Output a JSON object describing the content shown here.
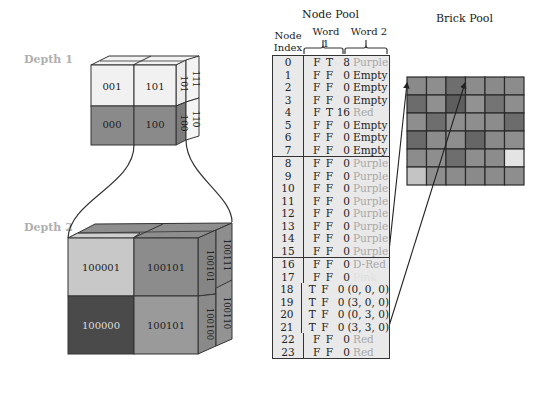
{
  "labels": {
    "depth1": "Depth 1",
    "depth2": "Depth 2",
    "node_pool": "Node Pool",
    "brick_pool": "Brick Pool",
    "node_index": "Node\nIndex",
    "node_index_line1": "Node",
    "node_index_line2": "Index",
    "word1": "Word 1",
    "word2": "Word 2"
  },
  "depth1_cube": {
    "front": [
      {
        "label": "001",
        "fill": "#f1f1f1"
      },
      {
        "label": "101",
        "fill": "#f1f1f1"
      },
      {
        "label": "000",
        "fill": "#8a8a8a"
      },
      {
        "label": "100",
        "fill": "#8a8a8a"
      }
    ],
    "side": [
      {
        "label": "101",
        "fill": "#ebebeb"
      },
      {
        "label": "111",
        "fill": "#f4f4f4"
      },
      {
        "label": "100",
        "fill": "#7c7c7c"
      },
      {
        "label": "110",
        "fill": "#f4f4f4"
      }
    ]
  },
  "depth2_cube": {
    "front": [
      {
        "label": "100001",
        "fill": "#c8c8c8"
      },
      {
        "label": "100101",
        "fill": "#8c8c8c"
      },
      {
        "label": "100000",
        "fill": "#4a4a4a"
      },
      {
        "label": "100101",
        "fill": "#9a9a9a"
      }
    ],
    "side": [
      {
        "label": "100101",
        "fill": "#858585"
      },
      {
        "label": "100111",
        "fill": "#8e8e8e"
      },
      {
        "label": "100100",
        "fill": "#8a8a8a"
      },
      {
        "label": "100110",
        "fill": "#939393"
      }
    ]
  },
  "node_pool": {
    "groups": [
      [
        {
          "index": "0",
          "word1": "F T",
          "num": "8",
          "word2": "Purple",
          "style": "light"
        },
        {
          "index": "1",
          "word1": "F F",
          "num": "0",
          "word2": "Empty",
          "style": "dark"
        },
        {
          "index": "2",
          "word1": "F F",
          "num": "0",
          "word2": "Empty",
          "style": "dark"
        },
        {
          "index": "3",
          "word1": "F F",
          "num": "0",
          "word2": "Empty",
          "style": "dark"
        },
        {
          "index": "4",
          "word1": "F T",
          "num": "16",
          "word2": "Red",
          "style": "light"
        },
        {
          "index": "5",
          "word1": "F F",
          "num": "0",
          "word2": "Empty",
          "style": "dark"
        },
        {
          "index": "6",
          "word1": "F F",
          "num": "0",
          "word2": "Empty",
          "style": "dark"
        },
        {
          "index": "7",
          "word1": "F F",
          "num": "0",
          "word2": "Empty",
          "style": "dark"
        }
      ],
      [
        {
          "index": "8",
          "word1": "F F",
          "num": "0",
          "word2": "Purple",
          "style": "light"
        },
        {
          "index": "9",
          "word1": "F F",
          "num": "0",
          "word2": "Purple",
          "style": "light"
        },
        {
          "index": "10",
          "word1": "F F",
          "num": "0",
          "word2": "Purple",
          "style": "light"
        },
        {
          "index": "11",
          "word1": "F F",
          "num": "0",
          "word2": "Purple",
          "style": "light"
        },
        {
          "index": "12",
          "word1": "F F",
          "num": "0",
          "word2": "Purple",
          "style": "light"
        },
        {
          "index": "13",
          "word1": "F F",
          "num": "0",
          "word2": "Purple",
          "style": "light"
        },
        {
          "index": "14",
          "word1": "F F",
          "num": "0",
          "word2": "Purple",
          "style": "light"
        },
        {
          "index": "15",
          "word1": "F F",
          "num": "0",
          "word2": "Purple",
          "style": "light"
        }
      ],
      [
        {
          "index": "16",
          "word1": "F F",
          "num": "0",
          "word2": "D-Red",
          "style": "light"
        },
        {
          "index": "17",
          "word1": "F F",
          "num": "0",
          "word2": "Pink",
          "style": "verylight"
        },
        {
          "index": "18",
          "word1": "T F",
          "num": "0",
          "word2": "(0, 0, 0)",
          "style": "dark"
        },
        {
          "index": "19",
          "word1": "T F",
          "num": "0",
          "word2": "(3, 0, 0)",
          "style": "dark"
        },
        {
          "index": "20",
          "word1": "T F",
          "num": "0",
          "word2": "(0, 3, 0)",
          "style": "dark"
        },
        {
          "index": "21",
          "word1": "T F",
          "num": "0",
          "word2": "(3, 3, 0)",
          "style": "dark"
        },
        {
          "index": "22",
          "word1": "F F",
          "num": "0",
          "word2": "Red",
          "style": "light"
        },
        {
          "index": "23",
          "word1": "F F",
          "num": "0",
          "word2": "Red",
          "style": "light"
        }
      ]
    ]
  },
  "brick_pool": {
    "rows": 6,
    "cols": 6,
    "cells": [
      [
        "#8a8a8a",
        "#8e8e8e",
        "#6e6e6e",
        "#8c8c8c",
        "#8a8a8a",
        "#8c8c8c"
      ],
      [
        "#6c6c6c",
        "#909090",
        "#5e5e5e",
        "#929292",
        "#747474",
        "#8e8e8e"
      ],
      [
        "#8e8e8e",
        "#6e6e6e",
        "#8e8e8e",
        "#8e8e8e",
        "#8c8c8c",
        "#6c6c6c"
      ],
      [
        "#6a6a6a",
        "#8c8c8c",
        "#8e8e8e",
        "#666666",
        "#8a8a8a",
        "#8e8e8e"
      ],
      [
        "#8c8c8c",
        "#8e8e8e",
        "#6e6e6e",
        "#8e8e8e",
        "#8c8c8c",
        "#e4e4e4"
      ],
      [
        "#c4c4c4",
        "#8e8e8e",
        "#8c8c8c",
        "#8a8a8a",
        "#8c8c8c",
        "#8e8e8e"
      ]
    ]
  }
}
